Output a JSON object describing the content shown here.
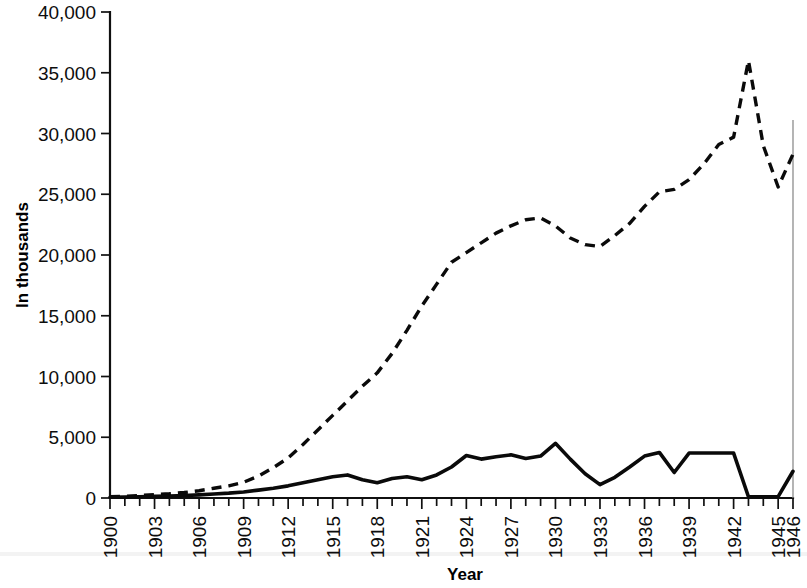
{
  "figure": {
    "background_color": "#ffffff",
    "ink_color": "#0a0a0a"
  },
  "chart_data": {
    "type": "line",
    "title": "",
    "subtitle": "",
    "xlabel": "Year",
    "ylabel": "In thousands",
    "xlim": [
      1900,
      1946
    ],
    "ylim": [
      0,
      40000
    ],
    "grid": false,
    "legend": null,
    "legend_position": "none",
    "y_ticks": [
      0,
      5000,
      10000,
      15000,
      20000,
      25000,
      30000,
      35000,
      40000
    ],
    "y_tick_labels": [
      "0",
      "5,000",
      "10,000",
      "15,000",
      "20,000",
      "25,000",
      "30,000",
      "35,000",
      "40,000"
    ],
    "x_ticks": [
      1900,
      1903,
      1906,
      1909,
      1912,
      1915,
      1918,
      1921,
      1924,
      1927,
      1930,
      1933,
      1936,
      1939,
      1942,
      1945,
      1946
    ],
    "x_tick_labels": [
      "1900",
      "1903",
      "1906",
      "1909",
      "1912",
      "1915",
      "1918",
      "1921",
      "1924",
      "1927",
      "1930",
      "1933",
      "1936",
      "1939",
      "1942",
      "1945",
      "1946"
    ],
    "x_minor_tick_interval": 1,
    "x": [
      1900,
      1901,
      1902,
      1903,
      1904,
      1905,
      1906,
      1907,
      1908,
      1909,
      1910,
      1911,
      1912,
      1913,
      1914,
      1915,
      1916,
      1917,
      1918,
      1919,
      1920,
      1921,
      1922,
      1923,
      1924,
      1925,
      1926,
      1927,
      1928,
      1929,
      1930,
      1931,
      1932,
      1933,
      1934,
      1935,
      1936,
      1937,
      1938,
      1939,
      1940,
      1941,
      1942,
      1943,
      1944,
      1945,
      1946
    ],
    "series": [
      {
        "name": "dashed-series",
        "style": "dashed",
        "values": [
          100,
          150,
          200,
          280,
          350,
          450,
          600,
          800,
          1000,
          1300,
          1800,
          2500,
          3300,
          4400,
          5600,
          6800,
          8000,
          9200,
          10300,
          11900,
          13800,
          15800,
          17600,
          19400,
          20200,
          21000,
          21800,
          22400,
          22900,
          23050,
          22400,
          21400,
          20850,
          20700,
          21600,
          22600,
          24000,
          25200,
          25400,
          26200,
          27500,
          29100,
          29700,
          36000,
          29000,
          25600,
          28300
        ]
      },
      {
        "name": "solid-series",
        "style": "solid",
        "values": [
          60,
          80,
          100,
          130,
          160,
          200,
          260,
          330,
          400,
          500,
          650,
          800,
          1000,
          1250,
          1500,
          1750,
          1900,
          1500,
          1250,
          1600,
          1750,
          1500,
          1900,
          2550,
          3500,
          3200,
          3400,
          3550,
          3250,
          3450,
          4500,
          3200,
          2000,
          1100,
          1700,
          2550,
          3450,
          3750,
          2100,
          3700,
          3700,
          3700,
          3700,
          100,
          100,
          120,
          2200
        ]
      }
    ],
    "annotations": []
  }
}
